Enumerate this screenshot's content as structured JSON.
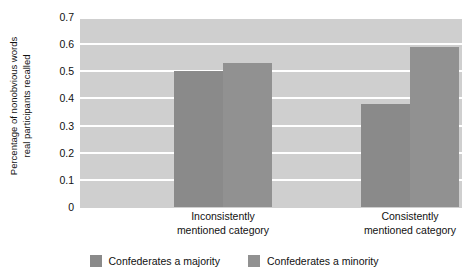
{
  "chart_data": {
    "type": "bar",
    "title": "",
    "xlabel": "",
    "ylabel_line1": "Percentage of nonobvious words",
    "ylabel_line2": "real participants recalled",
    "categories": [
      "Inconsistently mentioned category",
      "Consistently mentioned category"
    ],
    "category_lines": [
      [
        "Inconsistently",
        "mentioned category"
      ],
      [
        "Consistently",
        "mentioned category"
      ]
    ],
    "series": [
      {
        "name": "Confederates a majority",
        "values": [
          0.5,
          0.38
        ],
        "color": "#8a8a8a"
      },
      {
        "name": "Confederates a minority",
        "values": [
          0.53,
          0.59
        ],
        "color": "#919191"
      }
    ],
    "ylim": [
      0,
      0.7
    ],
    "yticks": [
      0.7,
      0.6,
      0.5,
      0.4,
      0.3,
      0.2,
      0.1,
      0
    ],
    "ytick_labels": [
      "0.7",
      "0.6",
      "0.5",
      "0.4",
      "0.3",
      "0.2",
      "0.1",
      "0"
    ],
    "grid": true,
    "grid_color": "#ffffff",
    "plot_background": "#cfcfcf",
    "legend_position": "bottom"
  }
}
